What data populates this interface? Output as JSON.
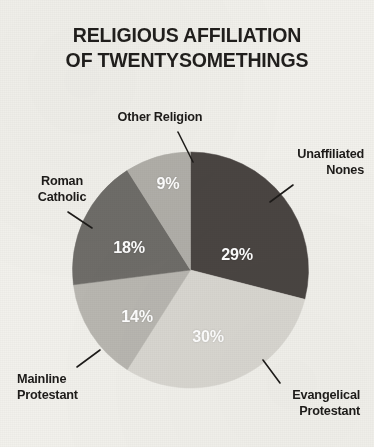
{
  "title": {
    "line1": "RELIGIOUS AFFILIATION",
    "line2": "OF TWENTYSOMETHINGS"
  },
  "colors": {
    "background": "#f2f1ec",
    "title_text": "#211f1d",
    "label_text": "#1d1b19",
    "value_text": "#ffffff",
    "leader_line": "#1d1b19",
    "unaffiliated": "#4a4542",
    "evangelical": "#d9d7d1",
    "mainline": "#b9b7b1",
    "roman_catholic": "#6f6d69",
    "other_religion": "#b1afa9"
  },
  "chart_data": {
    "type": "pie",
    "title": "RELIGIOUS AFFILIATION OF TWENTYSOMETHINGS",
    "xlabel": "",
    "ylabel": "",
    "legend_position": "callouts",
    "grid": false,
    "units": "percent",
    "start_angle_deg": 0,
    "direction": "clockwise",
    "categories": [
      "Unaffiliated Nones",
      "Evangelical Protestant",
      "Mainline Protestant",
      "Roman Catholic",
      "Other Religion"
    ],
    "values": [
      29,
      30,
      14,
      18,
      9
    ],
    "labels": [
      "29%",
      "30%",
      "14%",
      "18%",
      "9%"
    ],
    "slices": [
      {
        "name": "Unaffiliated Nones",
        "label_line1": "Unaffiliated",
        "label_line2": "Nones",
        "value": 29,
        "value_label": "29%",
        "color": "#4a4542"
      },
      {
        "name": "Evangelical Protestant",
        "label_line1": "Evangelical",
        "label_line2": "Protestant",
        "value": 30,
        "value_label": "30%",
        "color": "#d9d7d1"
      },
      {
        "name": "Mainline Protestant",
        "label_line1": "Mainline",
        "label_line2": "Protestant",
        "value": 14,
        "value_label": "14%",
        "color": "#b9b7b1"
      },
      {
        "name": "Roman Catholic",
        "label_line1": "Roman",
        "label_line2": "Catholic",
        "value": 18,
        "value_label": "18%",
        "color": "#6f6d69"
      },
      {
        "name": "Other Religion",
        "label_line1": "Other Religion",
        "label_line2": "",
        "value": 9,
        "value_label": "9%",
        "color": "#b1afa9"
      }
    ]
  }
}
